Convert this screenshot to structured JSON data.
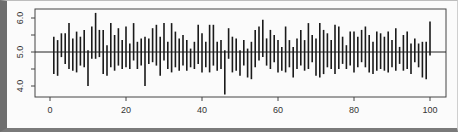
{
  "chart_data": {
    "type": "line",
    "subtype": "vertical-segments",
    "title": "",
    "xlabel": "",
    "ylabel": "",
    "xlim": [
      -2,
      104
    ],
    "ylim": [
      3.75,
      6.25
    ],
    "xticks": [
      0,
      20,
      40,
      60,
      80,
      100
    ],
    "xtick_labels": [
      "0",
      "20",
      "40",
      "60",
      "80",
      "100"
    ],
    "yticks": [
      4.0,
      4.5,
      5.0,
      5.5,
      6.0
    ],
    "ytick_labels": [
      "4.0",
      "",
      "5.0",
      "",
      "6.0"
    ],
    "reference_line": 5.0,
    "grid": false,
    "legend": "none",
    "x": [
      1,
      2,
      3,
      4,
      5,
      6,
      7,
      8,
      9,
      10,
      11,
      12,
      13,
      14,
      15,
      16,
      17,
      18,
      19,
      20,
      21,
      22,
      23,
      24,
      25,
      26,
      27,
      28,
      29,
      30,
      31,
      32,
      33,
      34,
      35,
      36,
      37,
      38,
      39,
      40,
      41,
      42,
      43,
      44,
      45,
      46,
      47,
      48,
      49,
      50,
      51,
      52,
      53,
      54,
      55,
      56,
      57,
      58,
      59,
      60,
      61,
      62,
      63,
      64,
      65,
      66,
      67,
      68,
      69,
      70,
      71,
      72,
      73,
      74,
      75,
      76,
      77,
      78,
      79,
      80,
      81,
      82,
      83,
      84,
      85,
      86,
      87,
      88,
      89,
      90,
      91,
      92,
      93,
      94,
      95,
      96,
      97,
      98,
      99,
      100
    ],
    "low": [
      4.35,
      4.3,
      4.85,
      4.65,
      4.5,
      4.45,
      4.4,
      4.6,
      4.55,
      4.0,
      4.8,
      4.8,
      4.85,
      4.35,
      4.3,
      4.55,
      4.45,
      4.6,
      4.5,
      4.55,
      4.5,
      4.75,
      4.5,
      4.6,
      4.0,
      4.65,
      4.7,
      4.6,
      4.3,
      4.75,
      4.5,
      4.4,
      4.55,
      4.45,
      4.6,
      4.45,
      4.55,
      4.5,
      4.65,
      4.4,
      4.55,
      4.4,
      4.6,
      4.45,
      4.5,
      3.75,
      4.8,
      4.4,
      4.45,
      4.3,
      4.6,
      4.25,
      4.2,
      4.55,
      4.75,
      4.85,
      4.6,
      4.5,
      4.7,
      4.4,
      4.45,
      4.4,
      4.55,
      4.25,
      4.5,
      4.6,
      4.45,
      4.5,
      4.7,
      4.3,
      4.25,
      4.35,
      4.55,
      4.5,
      4.35,
      4.5,
      4.65,
      4.5,
      4.6,
      4.4,
      4.55,
      4.7,
      4.55,
      4.4,
      4.35,
      4.45,
      4.5,
      4.45,
      4.4,
      4.55,
      4.45,
      4.65,
      4.45,
      4.5,
      4.35,
      4.7,
      4.55,
      4.25,
      4.2,
      4.9
    ],
    "high": [
      5.45,
      5.35,
      5.55,
      5.55,
      5.85,
      5.4,
      5.6,
      5.45,
      5.65,
      5.05,
      5.75,
      6.15,
      5.65,
      5.65,
      5.2,
      5.85,
      5.5,
      5.7,
      5.35,
      5.75,
      5.25,
      5.85,
      5.3,
      5.4,
      5.45,
      5.4,
      5.7,
      5.8,
      5.45,
      5.85,
      5.3,
      5.85,
      5.6,
      5.4,
      5.5,
      5.35,
      5.1,
      5.3,
      5.8,
      5.55,
      5.3,
      5.8,
      5.8,
      5.3,
      5.35,
      5.05,
      5.7,
      5.45,
      5.4,
      5.05,
      5.35,
      5.1,
      5.3,
      5.65,
      5.75,
      5.95,
      5.4,
      5.65,
      5.5,
      5.35,
      5.15,
      5.75,
      5.35,
      5.15,
      5.4,
      5.65,
      5.35,
      5.85,
      5.5,
      5.4,
      5.85,
      5.65,
      5.55,
      5.35,
      5.8,
      5.75,
      5.45,
      5.2,
      5.6,
      5.6,
      5.45,
      5.65,
      5.75,
      5.5,
      5.3,
      5.6,
      5.55,
      5.45,
      5.6,
      5.35,
      5.7,
      5.15,
      5.5,
      5.6,
      5.25,
      5.4,
      5.25,
      5.3,
      5.3,
      5.9
    ]
  }
}
